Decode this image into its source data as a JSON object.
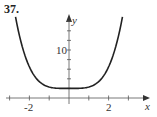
{
  "problem": {
    "number": "37."
  },
  "chart_data": {
    "type": "line",
    "title": "",
    "xlabel": "x",
    "ylabel": "y",
    "x_tick_labels": [
      "-2",
      "2"
    ],
    "y_tick_labels": [
      "10"
    ],
    "xlim": [
      -3,
      3.5
    ],
    "ylim": [
      0,
      17
    ],
    "x_tick_step": 1,
    "y_tick_step": 2,
    "grid": false,
    "series": [
      {
        "name": "curve",
        "x": [
          -2.7,
          -2.5,
          -2.0,
          -1.5,
          -1.0,
          -0.5,
          0,
          0.5,
          1.0,
          1.5,
          2.0,
          2.5,
          2.7
        ],
        "values": [
          16.0,
          12.8,
          6.5,
          3.4,
          2.3,
          2.0,
          2.0,
          2.0,
          2.3,
          3.4,
          6.5,
          12.8,
          16.0
        ]
      }
    ],
    "colors": {
      "curve": "#222222",
      "axes": "#555555"
    }
  }
}
